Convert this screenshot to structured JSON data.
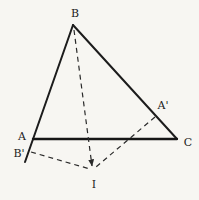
{
  "diagram": {
    "type": "geometry-figure",
    "background_color": "#f7f6f2",
    "line_color": "#1c1c1c",
    "labels": {
      "b": "B",
      "a": "A",
      "c": "C",
      "a_prime": "A'",
      "b_prime": "B'",
      "i": "I"
    }
  }
}
